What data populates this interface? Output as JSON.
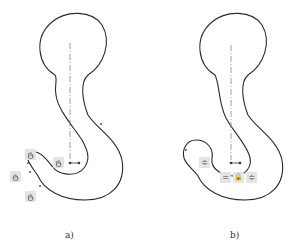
{
  "figure": {
    "panels": [
      {
        "label": "a)",
        "description": "hook sketch with tangent constraints",
        "constraint_icons": [
          {
            "type": "tangent-icon",
            "glyph": "ტ"
          },
          {
            "type": "tangent-icon",
            "glyph": "ტ"
          },
          {
            "type": "tangent-icon",
            "glyph": "ტ"
          },
          {
            "type": "tangent-icon",
            "glyph": "ტ"
          }
        ]
      },
      {
        "label": "b)",
        "description": "hook sketch with equal and fix constraints",
        "constraint_icons": [
          {
            "type": "equal-icon",
            "glyph": "≑"
          },
          {
            "type": "equal-icon",
            "glyph": "="
          },
          {
            "type": "lock-icon",
            "glyph": "🔒"
          },
          {
            "type": "equal-icon",
            "glyph": "≑"
          }
        ]
      }
    ],
    "colors": {
      "stroke": "#2a2a2a",
      "centerline": "#777777",
      "badge_bg": "#e4e4e4"
    }
  }
}
